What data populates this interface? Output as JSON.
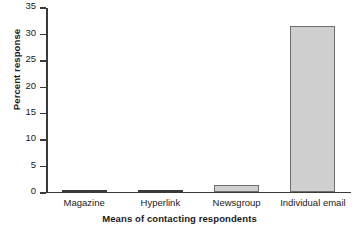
{
  "chart_data": {
    "type": "bar",
    "title": "",
    "xlabel": "Means of contacting respondents",
    "ylabel": "Percent response",
    "categories": [
      "Magazine",
      "Hyperlink",
      "Newsgroup",
      "Individual email"
    ],
    "values": [
      0,
      0.4,
      1.2,
      31.3
    ],
    "ylim": [
      0,
      35
    ],
    "ytick_labels": [
      "0",
      "5",
      "10",
      "15",
      "20",
      "25",
      "30",
      "35"
    ],
    "ytick_values": [
      0,
      5,
      10,
      15,
      20,
      25,
      30,
      35
    ],
    "grid": false,
    "legend": false,
    "bar_fill_color": "#cfcfcf",
    "bar_edge_color": "#6e6e6e",
    "axis_color": "#3a3a3a",
    "background_color": "#ffffff"
  }
}
